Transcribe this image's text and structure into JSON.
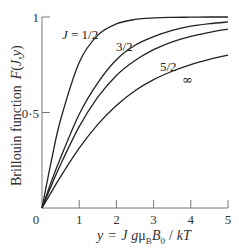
{
  "chart_data": {
    "type": "line",
    "title": "",
    "xlabel": "y = J gμB B0 / kT",
    "ylabel": "Brillouin function F(J,y)",
    "xlim": [
      0,
      5
    ],
    "ylim": [
      0,
      1
    ],
    "x_ticks": [
      1,
      2,
      3,
      4,
      5
    ],
    "x_tick_labels": [
      "1",
      "2",
      "3",
      "4",
      "5"
    ],
    "y_ticks": [
      0.5,
      1
    ],
    "y_tick_labels": [
      "0·5",
      "1"
    ],
    "origin_label": "0",
    "grid": false,
    "legend": "inline curve labels",
    "x": [
      0,
      0.25,
      0.5,
      1,
      1.5,
      2,
      2.5,
      3,
      3.5,
      4,
      4.5,
      5
    ],
    "series": [
      {
        "name": "J = 1/2",
        "label": "J = 1/2",
        "values": [
          0,
          0.245,
          0.462,
          0.762,
          0.905,
          0.964,
          0.987,
          0.995,
          0.998,
          0.999,
          1.0,
          1.0
        ]
      },
      {
        "name": "J = 3/2",
        "label": "3/2",
        "values": [
          0,
          0.138,
          0.263,
          0.491,
          0.655,
          0.776,
          0.852,
          0.897,
          0.93,
          0.952,
          0.965,
          0.974
        ]
      },
      {
        "name": "J = 5/2",
        "label": "5/2",
        "values": [
          0,
          0.117,
          0.228,
          0.426,
          0.58,
          0.694,
          0.772,
          0.829,
          0.87,
          0.899,
          0.92,
          0.937
        ]
      },
      {
        "name": "J = ∞",
        "label": "∞",
        "values": [
          0,
          0.083,
          0.164,
          0.313,
          0.438,
          0.537,
          0.614,
          0.672,
          0.716,
          0.751,
          0.778,
          0.8
        ]
      }
    ]
  },
  "labels": {
    "ylabel_text": "Brillouin function",
    "ylabel_func": "F(J,y)",
    "xlabel_parts": {
      "y": "y",
      "eq": "=",
      "J": "J",
      "g": "g",
      "mu": "μ",
      "B_sub": "B",
      "B": "B",
      "zero_sub": "0",
      "slash": "/",
      "kT": "kT"
    },
    "curve_labels": [
      "J = 1/2",
      "3/2",
      "5/2",
      "∞"
    ]
  }
}
